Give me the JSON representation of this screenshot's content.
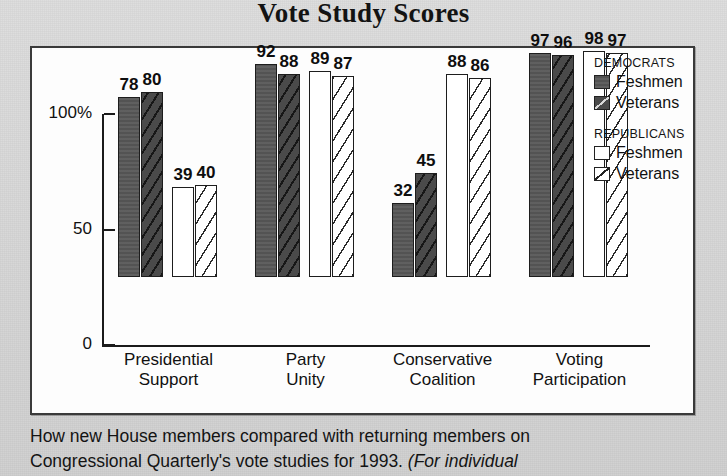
{
  "title": "Vote Study Scores",
  "caption": {
    "line1": "How new House members compared with returning members on",
    "line2a": "Congressional Quarterly's vote studies for 1993. ",
    "line2b": "(For individual"
  },
  "legend": {
    "group1_title": "DEMOCRATS",
    "group1_items": [
      {
        "label": "Feshmen",
        "swatch": "dem-freshmen-swatch"
      },
      {
        "label": "Veterans",
        "swatch": "dem-veterans-swatch"
      }
    ],
    "group2_title": "REPUBLICANS",
    "group2_items": [
      {
        "label": "Feshmen",
        "swatch": "rep-freshmen-swatch"
      },
      {
        "label": "Veterans",
        "swatch": "rep-veterans-swatch"
      }
    ]
  },
  "axis": {
    "y_ticks": [
      "100%",
      "50",
      "0"
    ]
  },
  "chart_data": {
    "type": "bar",
    "title": "Vote Study Scores",
    "xlabel": "",
    "ylabel": "",
    "ylim": [
      0,
      100
    ],
    "grid": false,
    "legend_position": "right",
    "categories": [
      "Presidential Support",
      "Party Unity",
      "Conservative Coalition",
      "Voting Participation"
    ],
    "category_lines": [
      [
        "Presidential",
        "Support"
      ],
      [
        "Party",
        "Unity"
      ],
      [
        "Conservative",
        "Coalition"
      ],
      [
        "Voting",
        "Participation"
      ]
    ],
    "series": [
      {
        "name": "Democrats Feshmen",
        "key": "dem-f",
        "values": [
          78,
          92,
          32,
          97
        ]
      },
      {
        "name": "Democrats Veterans",
        "key": "dem-v",
        "values": [
          80,
          88,
          45,
          96
        ]
      },
      {
        "name": "Republicans Feshmen",
        "key": "rep-f",
        "values": [
          39,
          89,
          88,
          98
        ]
      },
      {
        "name": "Republicans Veterans",
        "key": "rep-v",
        "values": [
          40,
          87,
          86,
          97
        ]
      }
    ]
  }
}
